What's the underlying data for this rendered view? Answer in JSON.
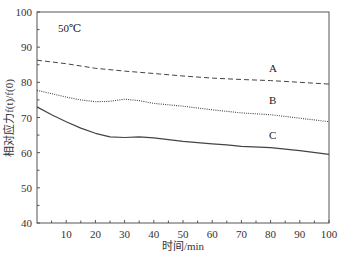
{
  "chart_data": {
    "type": "line",
    "title": "",
    "annotation": "50℃",
    "xlabel": "时间/min",
    "ylabel": "相对应力f(t)/f(0)",
    "xlim": [
      0,
      100
    ],
    "ylim": [
      40,
      100
    ],
    "xticks": [
      10,
      20,
      30,
      40,
      50,
      60,
      70,
      80,
      90,
      100
    ],
    "yticks": [
      40,
      50,
      60,
      70,
      80,
      90,
      100
    ],
    "grid": false,
    "legend": "inline labels",
    "series": [
      {
        "name": "A",
        "style": "dashed",
        "x": [
          0,
          10,
          20,
          30,
          40,
          50,
          60,
          70,
          80,
          90,
          100
        ],
        "y": [
          86.3,
          85.3,
          84.0,
          83.2,
          82.5,
          81.8,
          81.2,
          80.8,
          80.5,
          80.0,
          79.5
        ]
      },
      {
        "name": "B",
        "style": "dotted",
        "x": [
          0,
          5,
          10,
          15,
          20,
          25,
          30,
          35,
          40,
          50,
          60,
          70,
          80,
          90,
          100
        ],
        "y": [
          77.7,
          76.8,
          75.8,
          75.0,
          74.5,
          74.6,
          75.2,
          74.8,
          74.0,
          73.2,
          72.2,
          71.3,
          70.8,
          69.8,
          68.8
        ]
      },
      {
        "name": "C",
        "style": "solid",
        "x": [
          0,
          5,
          10,
          15,
          20,
          25,
          30,
          35,
          40,
          50,
          60,
          65,
          70,
          80,
          90,
          100
        ],
        "y": [
          73.0,
          70.8,
          68.8,
          67.0,
          65.5,
          64.5,
          64.3,
          64.5,
          64.2,
          63.2,
          62.5,
          62.2,
          61.8,
          61.4,
          60.6,
          59.5
        ]
      }
    ]
  },
  "labels": {
    "annotation": "50℃",
    "xlabel": "时间/min",
    "ylabel": "相对应力f(t)/f(0)",
    "curve_a": "A",
    "curve_b": "B",
    "curve_c": "C"
  }
}
